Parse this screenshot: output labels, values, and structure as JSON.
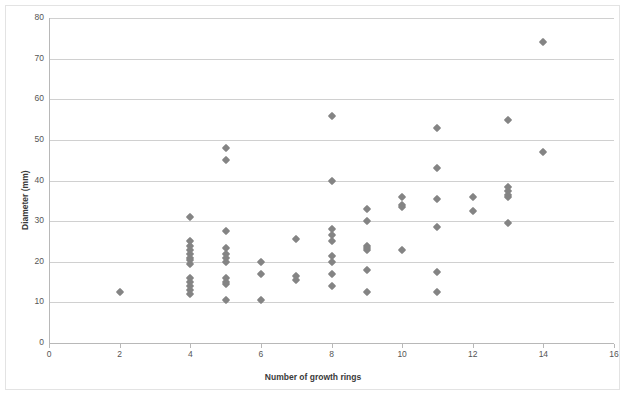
{
  "chart_data": {
    "type": "scatter",
    "title": "",
    "xlabel": "Number of growth rings",
    "ylabel": "Diameter (mm)",
    "xlim": [
      0,
      16
    ],
    "ylim": [
      0,
      80
    ],
    "xticks": [
      0,
      2,
      4,
      6,
      8,
      10,
      12,
      14,
      16
    ],
    "yticks": [
      0,
      10,
      20,
      30,
      40,
      50,
      60,
      70,
      80
    ],
    "grid": "horizontal",
    "legend": "none",
    "marker": "diamond",
    "marker_color": "#848484",
    "series": [
      {
        "name": "observations",
        "points": [
          [
            2,
            12.5
          ],
          [
            4,
            31
          ],
          [
            4,
            25
          ],
          [
            4,
            24
          ],
          [
            4,
            23
          ],
          [
            4,
            22
          ],
          [
            4,
            21
          ],
          [
            4,
            20.5
          ],
          [
            4,
            19.5
          ],
          [
            4,
            16
          ],
          [
            4,
            15
          ],
          [
            4,
            14
          ],
          [
            4,
            13
          ],
          [
            4,
            12
          ],
          [
            5,
            48
          ],
          [
            5,
            45
          ],
          [
            5,
            27.5
          ],
          [
            5,
            23.5
          ],
          [
            5,
            22
          ],
          [
            5,
            21
          ],
          [
            5,
            20
          ],
          [
            5,
            16
          ],
          [
            5,
            15
          ],
          [
            5,
            14.5
          ],
          [
            5,
            10.5
          ],
          [
            6,
            20
          ],
          [
            6,
            17
          ],
          [
            6,
            10.5
          ],
          [
            7,
            25.5
          ],
          [
            7,
            16.5
          ],
          [
            7,
            15.5
          ],
          [
            8,
            56
          ],
          [
            8,
            40
          ],
          [
            8,
            28
          ],
          [
            8,
            26.5
          ],
          [
            8,
            25
          ],
          [
            8,
            21.5
          ],
          [
            8,
            20
          ],
          [
            8,
            17
          ],
          [
            8,
            14
          ],
          [
            9,
            33
          ],
          [
            9,
            30
          ],
          [
            9,
            24
          ],
          [
            9,
            23.5
          ],
          [
            9,
            23
          ],
          [
            9,
            18
          ],
          [
            9,
            12.5
          ],
          [
            10,
            36
          ],
          [
            10,
            34
          ],
          [
            10,
            33.5
          ],
          [
            10,
            23
          ],
          [
            11,
            53
          ],
          [
            11,
            43
          ],
          [
            11,
            35.5
          ],
          [
            11,
            28.5
          ],
          [
            11,
            17.5
          ],
          [
            11,
            12.5
          ],
          [
            12,
            36
          ],
          [
            12,
            32.5
          ],
          [
            13,
            55
          ],
          [
            13,
            38.5
          ],
          [
            13,
            37.5
          ],
          [
            13,
            36.5
          ],
          [
            13,
            36
          ],
          [
            13,
            29.5
          ],
          [
            14,
            74
          ],
          [
            14,
            47
          ]
        ]
      }
    ]
  }
}
